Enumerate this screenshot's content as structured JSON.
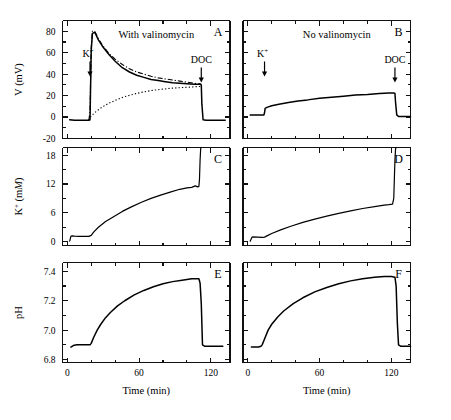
{
  "figure": {
    "width": 451,
    "height": 420,
    "background": "#ffffff",
    "ink_color": "#000000"
  },
  "columns": [
    {
      "key": "left",
      "condition_label": "With valinomycin"
    },
    {
      "key": "right",
      "condition_label": "No valinomycin"
    }
  ],
  "annotations": {
    "k_label": "K",
    "k_superscript": "+",
    "doc_label": "DOC"
  },
  "panel_letters": {
    "a": "A",
    "b": "B",
    "c": "C",
    "d": "D",
    "e": "E",
    "f": "F"
  },
  "axes": {
    "x": {
      "label": "Time (min)",
      "ticklabels": [
        "0",
        "60",
        "120"
      ],
      "tickvalues": [
        0,
        60,
        120
      ],
      "minor_step": 20,
      "range": [
        -4,
        136
      ]
    },
    "y_voltage": {
      "label_main": "V (mV)",
      "ticklabels": [
        "-20",
        "0",
        "20",
        "40",
        "60",
        "80"
      ],
      "tickvalues": [
        -20,
        0,
        20,
        40,
        60,
        80
      ],
      "range": [
        -20,
        90
      ]
    },
    "y_potassium": {
      "label_prefix": "K",
      "label_superscript": "+",
      "label_units_plain": " (m",
      "label_units_italic": "M",
      "label_units_close": ")",
      "ticklabels": [
        "0",
        "6",
        "12",
        "18"
      ],
      "tickvalues": [
        0,
        6,
        12,
        18
      ],
      "range": [
        -0.8,
        19.6
      ]
    },
    "y_ph": {
      "label_main": "pH",
      "ticklabels": [
        "6.8",
        "7.0",
        "7.2",
        "7.4"
      ],
      "tickvalues": [
        6.8,
        7.0,
        7.2,
        7.4
      ],
      "range": [
        6.78,
        7.46
      ]
    }
  },
  "chart_data": {
    "type": "line",
    "title": "",
    "xlabel": "Time (min)",
    "grid": false,
    "legend": "none",
    "panels": [
      {
        "id": "A",
        "letter": "A",
        "condition": "With valinomycin",
        "ylabel": "V (mV)",
        "ylim": [
          -20,
          90
        ],
        "xlim": [
          -4,
          136
        ],
        "event_markers": [
          {
            "label": "K+",
            "time": 19
          },
          {
            "label": "DOC",
            "time": 112
          }
        ],
        "series": [
          {
            "name": "membrane-potential-solid",
            "style": "solid",
            "x": [
              2,
              6,
              10,
              14,
              18,
              19,
              19.5,
              20,
              21,
              23,
              26,
              30,
              35,
              40,
              46,
              52,
              58,
              64,
              70,
              76,
              82,
              88,
              94,
              100,
              106,
              110,
              111.5,
              112,
              112.5,
              113.5,
              116,
              120,
              126,
              132
            ],
            "y": [
              -2.5,
              -3,
              -3,
              -3,
              -3,
              -2.5,
              30,
              62,
              78,
              79,
              72,
              65,
              58,
              52,
              46,
              42,
              39,
              37,
              35,
              34,
              33,
              32,
              31.5,
              31,
              30.5,
              30.5,
              30.5,
              30,
              12,
              -2.5,
              -3,
              -3,
              -3,
              -3
            ]
          },
          {
            "name": "model-prediction-dashdot",
            "style": "dashdot",
            "x": [
              18,
              19,
              20,
              21,
              23,
              26,
              30,
              35,
              40,
              46,
              52,
              58,
              64,
              70,
              76,
              82,
              88,
              94,
              100,
              106,
              110,
              111.5
            ],
            "y": [
              -3,
              5,
              64,
              80,
              80,
              73,
              66,
              59,
              54,
              49,
              45,
              42,
              40,
              38,
              36.5,
              35.5,
              34.5,
              33.5,
              32.5,
              31.5,
              31,
              31
            ]
          },
          {
            "name": "secondary-potential-dotted",
            "style": "dotted",
            "x": [
              18,
              20,
              24,
              28,
              34,
              40,
              48,
              56,
              64,
              72,
              80,
              88,
              96,
              104,
              110,
              112
            ],
            "y": [
              -3,
              1,
              5,
              8.5,
              12.5,
              15.5,
              19,
              21.5,
              23.5,
              25,
              26,
              27,
              27.5,
              28,
              28.5,
              28.5
            ]
          }
        ]
      },
      {
        "id": "B",
        "letter": "B",
        "condition": "No valinomycin",
        "ylabel": "V (mV)",
        "ylim": [
          -20,
          90
        ],
        "xlim": [
          -4,
          136
        ],
        "event_markers": [
          {
            "label": "K+",
            "time": 14
          },
          {
            "label": "DOC",
            "time": 123
          }
        ],
        "series": [
          {
            "name": "membrane-potential-solid",
            "style": "solid",
            "x": [
              2,
              6,
              10,
              13.5,
              14,
              14.5,
              16,
              20,
              26,
              34,
              42,
              50,
              60,
              70,
              80,
              90,
              100,
              110,
              118,
              122,
              123,
              123.5,
              124.5,
              126,
              130,
              136
            ],
            "y": [
              2,
              2,
              2,
              2,
              4,
              8,
              9,
              10.5,
              12,
              13.5,
              15,
              16,
              17.5,
              18.5,
              19.5,
              20.5,
              21,
              22,
              22.5,
              22.5,
              22,
              14,
              2,
              0.5,
              0.5,
              0.5
            ]
          }
        ]
      },
      {
        "id": "C",
        "letter": "C",
        "condition": "With valinomycin",
        "ylabel": "K+ (mM)",
        "ylim": [
          -0.8,
          19.6
        ],
        "xlim": [
          -4,
          136
        ],
        "series": [
          {
            "name": "potassium-concentration",
            "style": "solid-thin",
            "x": [
              2,
              3,
              4,
              6,
              10,
              14,
              18,
              20,
              22,
              26,
              32,
              38,
              46,
              54,
              62,
              70,
              78,
              86,
              94,
              100,
              104,
              107,
              109,
              110,
              110.5,
              111,
              111.5,
              112
            ],
            "y": [
              0.1,
              1.1,
              1.2,
              1.15,
              1.1,
              1.1,
              1.1,
              1.3,
              2.0,
              3.0,
              4.2,
              5.1,
              6.3,
              7.3,
              8.2,
              9.0,
              9.7,
              10.3,
              10.9,
              11.2,
              11.3,
              11.6,
              11.4,
              11.5,
              13,
              17,
              19.4,
              19.6
            ]
          }
        ]
      },
      {
        "id": "D",
        "letter": "D",
        "condition": "No valinomycin",
        "ylabel": "K+ (mM)",
        "ylim": [
          -0.8,
          19.6
        ],
        "xlim": [
          -4,
          136
        ],
        "series": [
          {
            "name": "potassium-concentration",
            "style": "solid-thin",
            "x": [
              2,
              3.5,
              4,
              8,
              12,
              14,
              16,
              20,
              28,
              36,
              46,
              56,
              66,
              76,
              86,
              96,
              106,
              114,
              118,
              121,
              122,
              122.5,
              123,
              123.5,
              124
            ],
            "y": [
              0.1,
              0.9,
              1.0,
              0.95,
              0.9,
              0.95,
              1.2,
              1.7,
              2.5,
              3.2,
              4.0,
              4.7,
              5.3,
              5.9,
              6.4,
              6.9,
              7.3,
              7.6,
              7.7,
              7.8,
              9,
              13,
              17,
              19.3,
              19.6
            ]
          }
        ]
      },
      {
        "id": "E",
        "letter": "E",
        "condition": "With valinomycin",
        "ylabel": "pH",
        "ylim": [
          6.78,
          7.46
        ],
        "xlim": [
          -4,
          136
        ],
        "series": [
          {
            "name": "external-ph",
            "style": "solid",
            "x": [
              3,
              5,
              8,
              12,
              16,
              19,
              20,
              22,
              25,
              28,
              32,
              36,
              42,
              48,
              56,
              64,
              72,
              80,
              88,
              96,
              104,
              108,
              110,
              111,
              112,
              113,
              115,
              118,
              124,
              130
            ],
            "y": [
              6.885,
              6.895,
              6.9,
              6.9,
              6.9,
              6.9,
              6.91,
              6.95,
              7.0,
              7.04,
              7.085,
              7.12,
              7.165,
              7.2,
              7.24,
              7.27,
              7.295,
              7.315,
              7.33,
              7.34,
              7.35,
              7.35,
              7.35,
              7.32,
              7.18,
              6.9,
              6.89,
              6.89,
              6.89,
              6.89
            ]
          }
        ]
      },
      {
        "id": "F",
        "letter": "F",
        "condition": "No valinomycin",
        "ylabel": "pH",
        "ylim": [
          6.78,
          7.46
        ],
        "xlim": [
          -4,
          136
        ],
        "series": [
          {
            "name": "external-ph",
            "style": "solid",
            "x": [
              3,
              6,
              9,
              11,
              12,
              14,
              17,
              20,
              25,
              30,
              38,
              46,
              56,
              66,
              76,
              86,
              96,
              106,
              114,
              120,
              123,
              124,
              125,
              126,
              128,
              132,
              136
            ],
            "y": [
              6.885,
              6.885,
              6.885,
              6.89,
              6.9,
              6.94,
              7.0,
              7.04,
              7.09,
              7.13,
              7.18,
              7.22,
              7.26,
              7.29,
              7.315,
              7.335,
              7.35,
              7.36,
              7.365,
              7.365,
              7.36,
              7.3,
              7.05,
              6.9,
              6.89,
              6.89,
              6.89
            ]
          }
        ]
      }
    ]
  }
}
